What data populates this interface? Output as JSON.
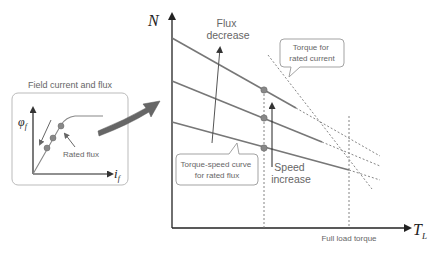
{
  "inset": {
    "title": "Field current and flux",
    "y_axis_label": "φ",
    "y_axis_sub": "f",
    "x_axis_label": "i",
    "x_axis_sub": "f",
    "annotation": "Rated flux"
  },
  "main": {
    "y_axis_label": "N",
    "x_axis_label": "T",
    "x_axis_sub": "L",
    "flux_decrease": [
      "Flux",
      "decrease"
    ],
    "speed_increase": [
      "Speed",
      "increase"
    ],
    "callout_torque_rated_current": [
      "Torque for",
      "rated current"
    ],
    "callout_torque_speed_curve": [
      "Torque-speed curve",
      "for rated flux"
    ],
    "full_load_label": "Full load torque"
  },
  "colors": {
    "curve": "#777777",
    "axis": "#333333",
    "dot": "#888888",
    "dashed": "#777777",
    "callout_border": "#999999",
    "big_arrow": "#666666"
  }
}
